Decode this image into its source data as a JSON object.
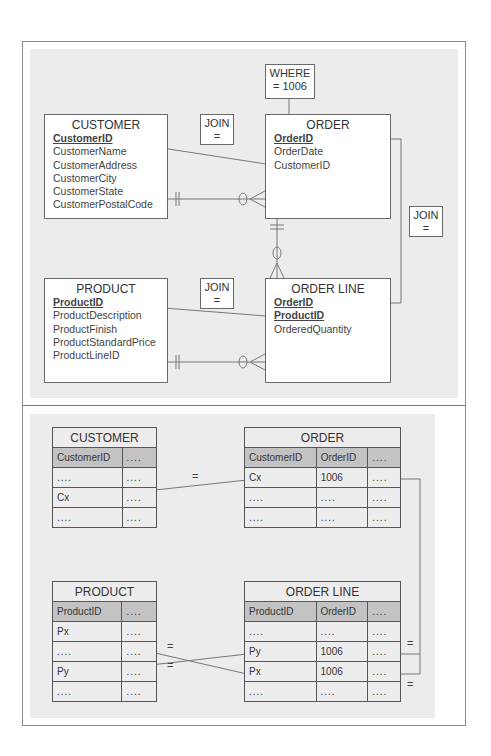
{
  "top_diagram": {
    "entities": {
      "customer": {
        "title": "CUSTOMER",
        "attributes": [
          {
            "name": "CustomerID",
            "pk": true
          },
          {
            "name": "CustomerName",
            "pk": false
          },
          {
            "name": "CustomerAddress",
            "pk": false
          },
          {
            "name": "CustomerCity",
            "pk": false
          },
          {
            "name": "CustomerState",
            "pk": false
          },
          {
            "name": "CustomerPostalCode",
            "pk": false
          }
        ]
      },
      "order": {
        "title": "ORDER",
        "attributes": [
          {
            "name": "OrderID",
            "pk": true
          },
          {
            "name": "OrderDate",
            "pk": false
          },
          {
            "name": "CustomerID",
            "pk": false
          }
        ]
      },
      "product": {
        "title": "PRODUCT",
        "attributes": [
          {
            "name": "ProductID",
            "pk": true
          },
          {
            "name": "ProductDescription",
            "pk": false
          },
          {
            "name": "ProductFinish",
            "pk": false
          },
          {
            "name": "ProductStandardPrice",
            "pk": false
          },
          {
            "name": "ProductLineID",
            "pk": false
          }
        ]
      },
      "order_line": {
        "title": "ORDER LINE",
        "attributes": [
          {
            "name": "OrderID",
            "pk": true
          },
          {
            "name": "ProductID",
            "pk": true
          },
          {
            "name": "OrderedQuantity",
            "pk": false
          }
        ]
      }
    },
    "notes": {
      "where_line1": "WHERE",
      "where_line2": "= 1006",
      "join_label": "JOIN",
      "join_eq": "="
    }
  },
  "bottom_diagram": {
    "customer": {
      "title": "CUSTOMER",
      "header": [
        "CustomerID",
        "...."
      ],
      "rows": [
        [
          "....",
          "...."
        ],
        [
          "Cx",
          "...."
        ],
        [
          "....",
          "...."
        ]
      ]
    },
    "order": {
      "title": "ORDER",
      "header": [
        "CustomerID",
        "OrderID",
        "...."
      ],
      "rows": [
        [
          "Cx",
          "1006",
          "...."
        ],
        [
          "....",
          "....",
          "...."
        ],
        [
          "....",
          "....",
          "...."
        ]
      ]
    },
    "product": {
      "title": "PRODUCT",
      "header": [
        "ProductID",
        "...."
      ],
      "rows": [
        [
          "Px",
          "...."
        ],
        [
          "....",
          "...."
        ],
        [
          "Py",
          "...."
        ],
        [
          "....",
          "...."
        ]
      ]
    },
    "order_line": {
      "title": "ORDER LINE",
      "header": [
        "ProductID",
        "OrderID",
        "...."
      ],
      "rows": [
        [
          "....",
          "....",
          "...."
        ],
        [
          "Py",
          "1006",
          "...."
        ],
        [
          "Px",
          "1006",
          "...."
        ],
        [
          "....",
          "....",
          "...."
        ]
      ]
    },
    "equals": "="
  },
  "colors": {
    "background_panel": "#ececec",
    "table_header": "#c3c3c3",
    "line": "#777777"
  }
}
